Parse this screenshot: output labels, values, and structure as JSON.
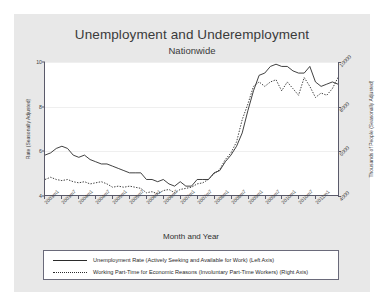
{
  "chart_data": {
    "type": "line",
    "title": "Unemployment and Underemployment",
    "subtitle": "Nationwide",
    "xlabel": "Month and Year",
    "ylabel_left": "Rate (Seasonally Adjusted)",
    "ylabel_right": "Thousands of People (Seasonally Adjusted)",
    "grid": true,
    "legend_position": "bottom",
    "ylim_left": [
      4,
      10
    ],
    "yticks_left": [
      "4",
      "6",
      "8",
      "10"
    ],
    "ylim_right": [
      4000,
      10000
    ],
    "yticks_right": [
      "4000",
      "6000",
      "8000",
      "10000"
    ],
    "xticks": [
      "2003m1",
      "2003m7",
      "2004m1",
      "2004m7",
      "2005m1",
      "2005m7",
      "2006m1",
      "2006m7",
      "2007m1",
      "2007m7",
      "2008m1",
      "2008m7",
      "2009m1",
      "2009m7",
      "2010m1",
      "2010m7",
      "2011m1"
    ],
    "x": [
      "2003m1",
      "2003m3",
      "2003m5",
      "2003m7",
      "2003m9",
      "2003m11",
      "2004m1",
      "2004m3",
      "2004m5",
      "2004m7",
      "2004m9",
      "2004m11",
      "2005m1",
      "2005m3",
      "2005m5",
      "2005m7",
      "2005m9",
      "2005m11",
      "2006m1",
      "2006m3",
      "2006m5",
      "2006m7",
      "2006m9",
      "2006m11",
      "2007m1",
      "2007m3",
      "2007m5",
      "2007m7",
      "2007m9",
      "2007m11",
      "2008m1",
      "2008m3",
      "2008m5",
      "2008m7",
      "2008m9",
      "2008m11",
      "2009m1",
      "2009m3",
      "2009m5",
      "2009m7",
      "2009m9",
      "2009m11",
      "2010m1",
      "2010m3",
      "2010m5",
      "2010m7",
      "2010m9",
      "2010m11",
      "2011m1",
      "2011m3",
      "2011m5",
      "2011m7",
      "2011m9"
    ],
    "series": [
      {
        "name": "Unemployment Rate (Actively Seeking and Available for Work) (Left Axis)",
        "axis": "left",
        "style": "solid",
        "color": "#2b2b2b",
        "values": [
          5.8,
          5.9,
          6.1,
          6.2,
          6.1,
          5.8,
          5.7,
          5.8,
          5.6,
          5.5,
          5.4,
          5.4,
          5.3,
          5.2,
          5.1,
          5.0,
          5.0,
          5.0,
          4.7,
          4.7,
          4.6,
          4.7,
          4.5,
          4.4,
          4.6,
          4.4,
          4.4,
          4.7,
          4.7,
          4.7,
          5.0,
          5.1,
          5.5,
          5.8,
          6.2,
          6.8,
          7.8,
          8.7,
          9.4,
          9.5,
          9.8,
          9.9,
          9.8,
          9.8,
          9.6,
          9.5,
          9.5,
          9.8,
          9.1,
          8.9,
          9.0,
          9.1,
          9.0
        ]
      },
      {
        "name": "Working Part-Time for Economic Reasons (Involuntary Part-Time Workers) (Right Axis)",
        "axis": "right",
        "style": "dotted",
        "color": "#2b2b2b",
        "values": [
          4700,
          4800,
          4700,
          4650,
          4700,
          4600,
          4550,
          4600,
          4500,
          4550,
          4600,
          4500,
          4350,
          4400,
          4350,
          4400,
          4350,
          4300,
          4100,
          4150,
          4050,
          4200,
          4250,
          4100,
          4250,
          4300,
          4350,
          4500,
          4550,
          4700,
          4950,
          5150,
          5600,
          5900,
          6400,
          7400,
          8100,
          8900,
          9100,
          8900,
          9100,
          9200,
          8700,
          9100,
          8800,
          8500,
          9300,
          8900,
          8400,
          8600,
          8500,
          8800,
          9300
        ]
      }
    ]
  },
  "legend": {
    "entries": [
      {
        "label": "Unemployment Rate (Actively Seeking and Available for Work) (Left Axis)",
        "style": "solid"
      },
      {
        "label": "Working Part-Time for Economic Reasons (Involuntary Part-Time Workers) (Right Axis)",
        "style": "dotted"
      }
    ]
  }
}
